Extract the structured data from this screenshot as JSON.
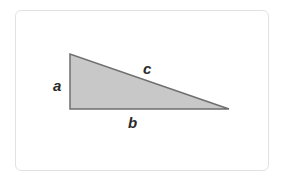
{
  "diagram": {
    "type": "right-triangle",
    "fill_color": "#c8c8c8",
    "stroke_color": "#6e6e6e",
    "vertices": {
      "top": [
        70,
        54
      ],
      "right_angle": [
        70,
        109
      ],
      "far": [
        229,
        109
      ]
    },
    "labels": {
      "a": "a",
      "b": "b",
      "c": "c"
    }
  }
}
